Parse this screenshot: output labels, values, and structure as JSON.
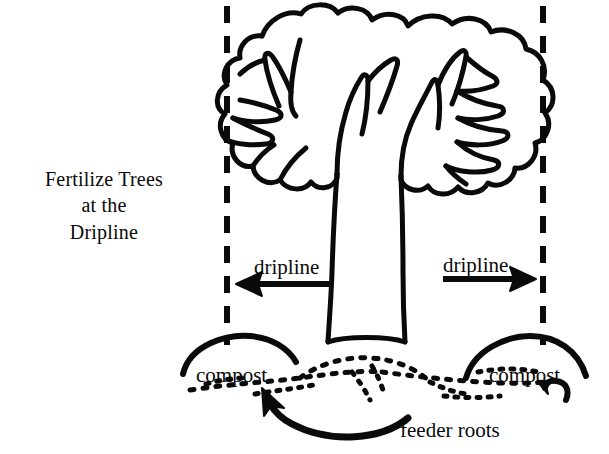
{
  "figure": {
    "title_lines": [
      "Fertilize Trees",
      "at the",
      "Dripline"
    ],
    "labels": {
      "dripline_left": "dripline",
      "dripline_right": "dripline",
      "compost_left": "compost",
      "compost_right": "compost",
      "feeder_roots": "feeder roots"
    },
    "colors": {
      "ink": "#0a0a0a",
      "background": "#ffffff"
    },
    "icons": {
      "arrow_left": "arrow-left-icon",
      "arrow_right": "arrow-right-icon",
      "arrow_curved_feeder": "curved-arrow-icon",
      "arrow_hook_compost": "hooked-arrow-icon",
      "tree": "tree-icon",
      "dripline_guide_left": "dashed-vertical-line-icon",
      "dripline_guide_right": "dashed-vertical-line-icon",
      "compost_mound_left": "compost-mound-icon",
      "compost_mound_right": "compost-mound-icon",
      "feeder_root_network": "dotted-roots-icon"
    }
  }
}
